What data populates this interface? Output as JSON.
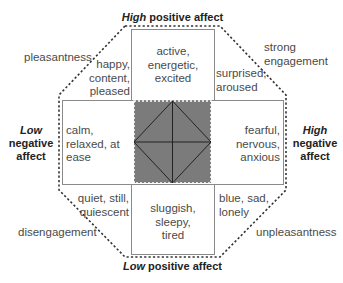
{
  "diagram": {
    "type": "affect-circumplex",
    "axes": {
      "top": {
        "emph": "High",
        "rest": " positive affect"
      },
      "bottom": {
        "emph": "Low",
        "rest": " positive affect"
      },
      "left": {
        "emph": "Low",
        "line2": "negative",
        "line3": "affect"
      },
      "right": {
        "emph": "High",
        "line2": "negative",
        "line3": "affect"
      }
    },
    "diagonals": {
      "top_left": "pleasantness",
      "top_right_1": "strong",
      "top_right_2": "engagement",
      "bottom_left": "disengagement",
      "bottom_right": "unpleasantness"
    },
    "cells": {
      "top": [
        "active,",
        "energetic,",
        "excited"
      ],
      "top_left": [
        "happy,",
        "content,",
        "pleased"
      ],
      "top_right": [
        "surprised,",
        "aroused"
      ],
      "left": [
        "calm,",
        "relaxed, at",
        "ease"
      ],
      "right": [
        "fearful,",
        "nervous,",
        "anxious"
      ],
      "bottom_left": [
        "quiet, still,",
        "quiescent"
      ],
      "bottom": [
        "sluggish,",
        "sleepy,",
        "tired"
      ],
      "bottom_right": [
        "blue, sad,",
        "lonely"
      ]
    },
    "colors": {
      "box_border": "#888888",
      "center_fill": "#7a7a7a",
      "dashed": "#333333",
      "text": "#4a4a4a"
    }
  }
}
